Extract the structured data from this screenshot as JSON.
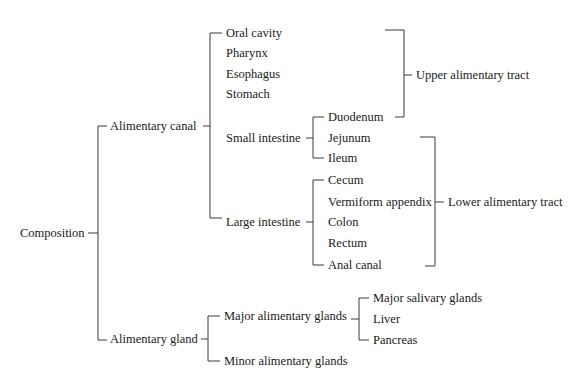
{
  "diagram": {
    "type": "tree-bracket",
    "line_color": "#3a3a3a",
    "text_color": "#1a1a1a",
    "root": {
      "label": "Composition",
      "x": 20,
      "y": 233
    },
    "nodes": [
      {
        "id": "canal",
        "label": "Alimentary canal",
        "x": 110,
        "y": 126
      },
      {
        "id": "gland",
        "label": "Alimentary gland",
        "x": 110,
        "y": 339
      },
      {
        "id": "oral",
        "label": "Oral cavity",
        "x": 226,
        "y": 33
      },
      {
        "id": "pharynx",
        "label": "Pharynx",
        "x": 226,
        "y": 53
      },
      {
        "id": "esophagus",
        "label": "Esophagus",
        "x": 226,
        "y": 74
      },
      {
        "id": "stomach",
        "label": "Stomach",
        "x": 226,
        "y": 94
      },
      {
        "id": "small",
        "label": "Small intestine",
        "x": 226,
        "y": 138
      },
      {
        "id": "large",
        "label": "Large intestine",
        "x": 226,
        "y": 222
      },
      {
        "id": "duodenum",
        "label": "Duodenum",
        "x": 328,
        "y": 117
      },
      {
        "id": "jejunum",
        "label": "Jejunum",
        "x": 328,
        "y": 138
      },
      {
        "id": "ileum",
        "label": "Ileum",
        "x": 328,
        "y": 158
      },
      {
        "id": "cecum",
        "label": "Cecum",
        "x": 328,
        "y": 180
      },
      {
        "id": "appendix",
        "label": "Vermiform appendix",
        "x": 328,
        "y": 202
      },
      {
        "id": "colon",
        "label": "Colon",
        "x": 328,
        "y": 222
      },
      {
        "id": "rectum",
        "label": "Rectum",
        "x": 328,
        "y": 243
      },
      {
        "id": "anal",
        "label": "Anal canal",
        "x": 328,
        "y": 265
      },
      {
        "id": "upper",
        "label": "Upper alimentary tract",
        "x": 416,
        "y": 75
      },
      {
        "id": "lower",
        "label": "Lower alimentary tract",
        "x": 448,
        "y": 202
      },
      {
        "id": "major",
        "label": "Major alimentary glands",
        "x": 224,
        "y": 316
      },
      {
        "id": "minor",
        "label": "Minor alimentary glands",
        "x": 224,
        "y": 361
      },
      {
        "id": "salivary",
        "label": "Major salivary glands",
        "x": 373,
        "y": 298
      },
      {
        "id": "liver",
        "label": "Liver",
        "x": 373,
        "y": 319
      },
      {
        "id": "pancreas",
        "label": "Pancreas",
        "x": 373,
        "y": 340
      }
    ]
  }
}
